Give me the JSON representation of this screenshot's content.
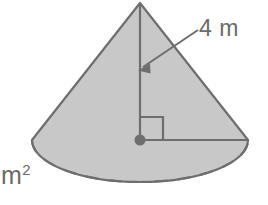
{
  "figure": {
    "name": "cone-geometry-diagram",
    "shape": "cone"
  },
  "labels": {
    "height_label": "4 m",
    "unit_label_base": "m",
    "unit_label_exponent": "2",
    "unit_label_full": "m2"
  },
  "colors": {
    "fill": "#c8c8c8",
    "stroke": "#6e6e6e",
    "text": "#6a6a6a",
    "background": "#ffffff",
    "dashed": "#6e6e6e"
  },
  "geometry": {
    "apex": {
      "x": 140,
      "y": 3
    },
    "base_center": {
      "x": 140,
      "y": 140
    },
    "base_radius_x": 108,
    "base_radius_y": 42,
    "height_line": {
      "x1": 140,
      "y1": 3,
      "x2": 140,
      "y2": 140
    },
    "radius_line": {
      "x1": 140,
      "y1": 140,
      "x2": 248,
      "y2": 140
    },
    "right_angle_size": 23,
    "leader_line": {
      "x1": 198,
      "y1": 30,
      "x2": 140,
      "y2": 70
    },
    "center_dot_radius": 5.5
  },
  "measurements": {
    "height_value": 4,
    "height_unit": "m",
    "area_unit": "m2"
  }
}
